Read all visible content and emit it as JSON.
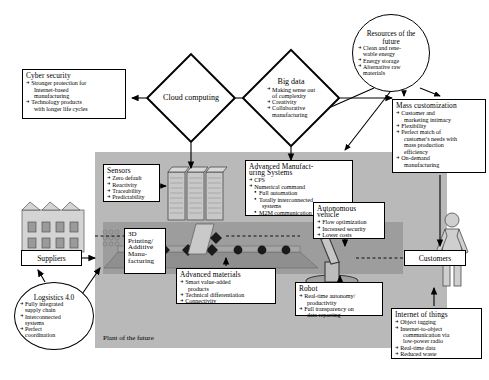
{
  "diagram": {
    "title": "Plant of the future",
    "plant_label": "Plant of the future"
  },
  "nodes": {
    "cyber_security": {
      "title": "Cyber security",
      "items": [
        "Stronger protection for",
        "Internet-based",
        "manufacturing",
        "Technology products",
        "with longer life cycles"
      ]
    },
    "cloud_computing": {
      "title": "Cloud computing"
    },
    "big_data": {
      "title": "Big data",
      "items": [
        "Making sense out",
        "of complexity",
        "Creativity",
        "Collaborative",
        "manufacturing"
      ]
    },
    "resources_future": {
      "title": "Resources of the future",
      "items": [
        "Clean and rene-",
        "wable energy",
        "Energy storage",
        "Alternative raw",
        "materials"
      ]
    },
    "mass_customization": {
      "title": "Mass customization",
      "items": [
        "Customer and",
        "marketing intimacy",
        "Flexibility",
        "Perfect match of",
        "customer's needs with",
        "mass production",
        "efficiency",
        "On-demand",
        "manufacturing"
      ]
    },
    "sensors": {
      "title": "Sensors",
      "items": [
        "Zero default",
        "Reactivity",
        "Traceability",
        "Predictability"
      ]
    },
    "advanced_manufacturing": {
      "title": "Advanced Manufact-uring Systems",
      "title_line1": "Advanced Manufact-",
      "title_line2": "uring Systems",
      "items": [
        "CPS",
        "Numerical command"
      ],
      "subitems": [
        "Full automation",
        "Totally interconnected",
        "systems",
        "M2M communication"
      ]
    },
    "autonomous_vehicle": {
      "title_line1": "Autonomous",
      "title_line2": "vehicle",
      "items": [
        "Flow optimization",
        "Increased security",
        "Lower costs"
      ]
    },
    "printing_3d": {
      "lines": [
        "3D",
        "Printing/",
        "Additive",
        "Manu-",
        "facturing"
      ]
    },
    "advanced_materials": {
      "title": "Advanced materials",
      "items": [
        "Smart value-added",
        "products",
        "Technical differentiation",
        "Connectivity"
      ]
    },
    "robot": {
      "title": "Robot",
      "items": [
        "Real-time autonomy/",
        "productivity",
        "Full transparency on",
        "data reporting"
      ]
    },
    "internet_of_things": {
      "title": "Internet of things",
      "items": [
        "Object tagging",
        "Internet-to-object",
        "communication via",
        "low-power radio",
        "Real-time data",
        "Reduced waste"
      ]
    },
    "logistics": {
      "title": "Logsistics 4.0",
      "items": [
        "Fully integrated",
        "supply chain",
        "Interconnected",
        "systems",
        "Perfect",
        "coordination"
      ]
    },
    "suppliers": {
      "label": "Suppliers"
    },
    "customers": {
      "label": "Customers"
    }
  },
  "colors": {
    "plant_background": "#b9b9b9",
    "floor": "#9d9d9d",
    "line": "#000000",
    "box_background": "#ffffff"
  }
}
